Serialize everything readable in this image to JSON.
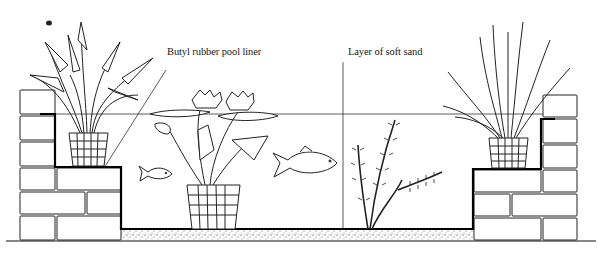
{
  "diagram": {
    "labels": [
      {
        "id": "liner",
        "text": "Butyl rubber pool liner",
        "x": 167,
        "y": 52
      },
      {
        "id": "sand",
        "text": "Layer of soft sand",
        "x": 348,
        "y": 53
      }
    ],
    "elements": [
      "left-brick-wall",
      "right-brick-wall",
      "left-marginal-plant-arrowhead",
      "right-marginal-plant-iris",
      "water-lily-in-basket",
      "small-fish",
      "goldfish",
      "oxygenating-weed",
      "sand-layer",
      "water-line",
      "pond-liner"
    ],
    "colors": {
      "ink": "#111111",
      "paper": "#ffffff",
      "sand": "#cfcfcf"
    }
  }
}
